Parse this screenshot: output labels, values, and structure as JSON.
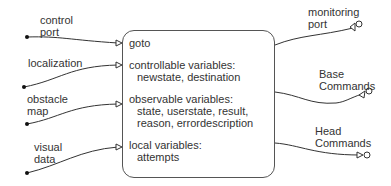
{
  "component": {
    "name": "goto",
    "sections": [
      {
        "heading": "controllable variables:",
        "items": "newstate, destination"
      },
      {
        "heading": "observable variables:",
        "items_line1": "state, userstate, result,",
        "items_line2": "reason, errordescription"
      },
      {
        "heading": "local variables:",
        "items": "attempts"
      }
    ]
  },
  "inputs": [
    {
      "label_line1": "control",
      "label_line2": "port"
    },
    {
      "label_line1": "localization"
    },
    {
      "label_line1": "obstacle",
      "label_line2": "map"
    },
    {
      "label_line1": "visual",
      "label_line2": "data"
    }
  ],
  "outputs": [
    {
      "label_line1": "monitoring",
      "label_line2": "port"
    },
    {
      "label_line1": "Base",
      "label_line2": "Commands"
    },
    {
      "label_line1": "Head",
      "label_line2": "Commands"
    }
  ]
}
